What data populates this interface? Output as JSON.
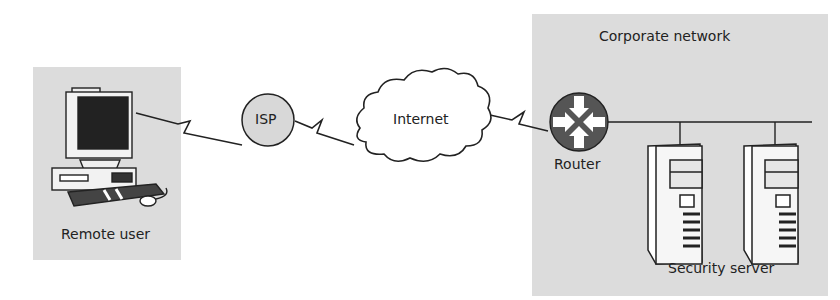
{
  "diagram": {
    "type": "network-topology",
    "zones": {
      "remote": {
        "label": "Remote user"
      },
      "corporate": {
        "label": "Corporate network"
      }
    },
    "nodes": {
      "isp": {
        "label": "ISP"
      },
      "internet": {
        "label": "Internet"
      },
      "router": {
        "label": "Router"
      },
      "servers": {
        "label": "Security server"
      }
    },
    "links": [
      {
        "from": "Remote user",
        "to": "ISP",
        "style": "lightning"
      },
      {
        "from": "ISP",
        "to": "Internet",
        "style": "lightning"
      },
      {
        "from": "Internet",
        "to": "Router",
        "style": "lightning"
      },
      {
        "from": "Router",
        "to": "Security server",
        "style": "bus"
      }
    ],
    "colors": {
      "zone_fill": "#dcdcdc",
      "router_fill": "#555555",
      "line": "#222222"
    }
  }
}
